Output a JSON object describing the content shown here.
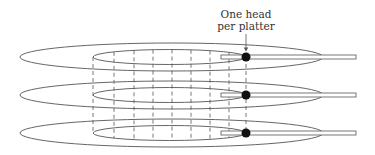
{
  "diagram": {
    "annotation": {
      "line1": "One head",
      "line2": "per platter"
    },
    "platters": [
      {
        "id": "platter-1",
        "cy": 57
      },
      {
        "id": "platter-2",
        "cy": 95
      },
      {
        "id": "platter-3",
        "cy": 133
      }
    ],
    "geometry": {
      "outer_cx": 171.5,
      "outer_rx": 151.5,
      "outer_ry": 14,
      "inner_cx": 169.5,
      "inner_rx": 76.5,
      "inner_ry": 7.5,
      "arm_x1": 221,
      "arm_x2": 356,
      "arm_h": 4,
      "head_x": 246,
      "head_r": 4.5,
      "cylinder_lines_x": [
        93,
        114,
        134,
        153,
        172,
        191,
        210,
        229,
        246
      ]
    },
    "colors": {
      "line": "#555555",
      "head": "#111111",
      "text": "#333333",
      "background": "#ffffff"
    }
  }
}
